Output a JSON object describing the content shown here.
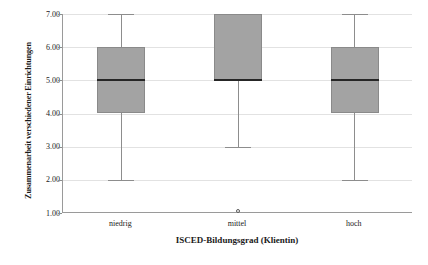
{
  "chart_data": {
    "type": "box",
    "title": "",
    "xlabel": "ISCED-Bildungsgrad (Klientin)",
    "ylabel": "Zusammenarbeit verschiedener Einrichtungen",
    "categories": [
      "niedrig",
      "mittel",
      "hoch"
    ],
    "ylim": [
      1.0,
      7.0
    ],
    "yticks": [
      "1.00",
      "2.00",
      "3.00",
      "4.00",
      "5.00",
      "6.00",
      "7.00"
    ],
    "ytick_values": [
      1,
      2,
      3,
      4,
      5,
      6,
      7
    ],
    "grid": true,
    "legend": "none",
    "boxes": [
      {
        "category": "niedrig",
        "whisker_low": 2.0,
        "q1": 4.0,
        "median": 5.0,
        "q3": 6.0,
        "whisker_high": 7.0,
        "outliers": []
      },
      {
        "category": "mittel",
        "whisker_low": 3.0,
        "q1": 5.0,
        "median": 5.0,
        "q3": 7.0,
        "whisker_high": 7.0,
        "outliers": [
          1.0
        ]
      },
      {
        "category": "hoch",
        "whisker_low": 2.0,
        "q1": 4.0,
        "median": 5.0,
        "q3": 6.0,
        "whisker_high": 7.0,
        "outliers": []
      }
    ],
    "colors": {
      "box_fill": "#a3a3a3",
      "box_edge": "#8a8a8a",
      "median": "#262626",
      "whisker": "#8d8d8d",
      "grid": "#e2e2e2",
      "axis": "#9a9a9a",
      "text": "#1a1a1a",
      "background": "#ffffff"
    }
  }
}
